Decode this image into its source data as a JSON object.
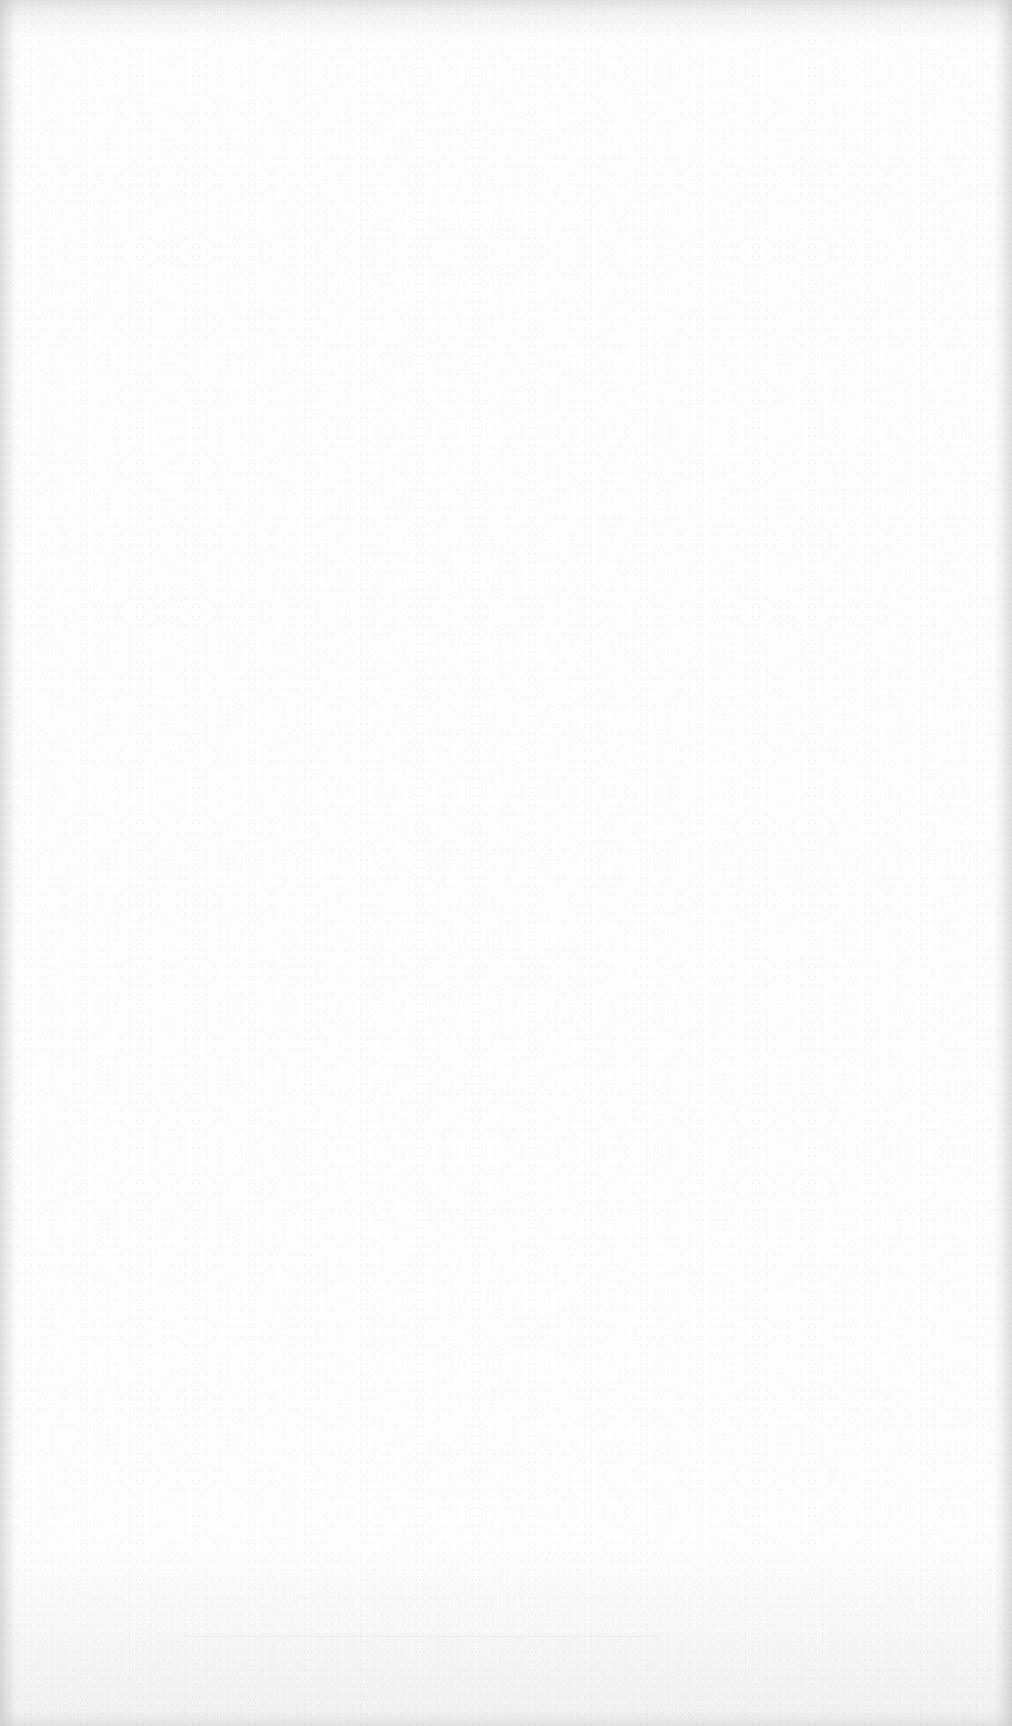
{
  "document": {
    "type": "blank-scanned-page",
    "text": "",
    "colors": {
      "paper": "#fdfdfd",
      "edge_shadow": "#e9e9e9"
    }
  }
}
